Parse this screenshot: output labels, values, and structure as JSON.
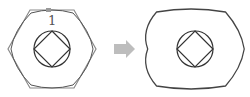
{
  "diagram": {
    "before": {
      "label": "1",
      "outline_color": "#888888",
      "shape": "hexagon",
      "inner": [
        "circle",
        "rotated-square"
      ]
    },
    "arrow": {
      "color": "#bdbdbd",
      "direction": "right"
    },
    "after": {
      "outline_color": "#444444",
      "shape": "filleted-hexagon",
      "inner": [
        "circle",
        "rotated-square"
      ]
    }
  }
}
